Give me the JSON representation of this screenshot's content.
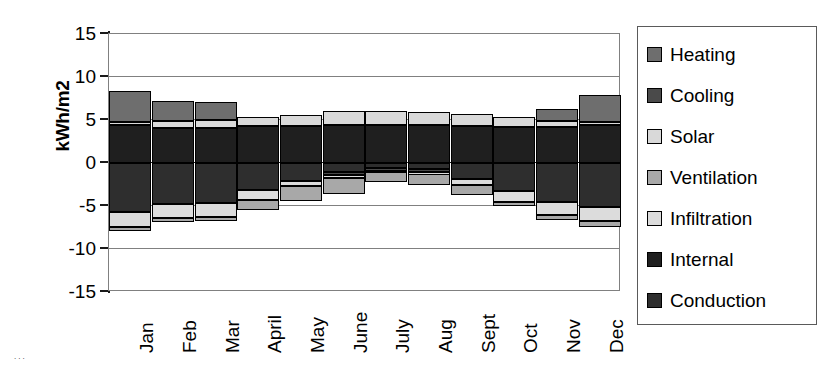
{
  "chart_data": {
    "type": "bar",
    "subtype": "stacked-diverging",
    "title": "",
    "xlabel": "",
    "ylabel": "kWh/m2",
    "ylim": [
      -15,
      15
    ],
    "yticks": [
      15,
      10,
      5,
      0,
      -5,
      -10,
      -15
    ],
    "ytick_labels": [
      "15",
      "10",
      "5",
      "0",
      "-5",
      "-10",
      "-15"
    ],
    "grid": true,
    "grid_axis": "y",
    "legend_position": "right",
    "categories": [
      "Jan",
      "Feb",
      "Mar",
      "April",
      "May",
      "June",
      "July",
      "Aug",
      "Sept",
      "Oct",
      "Nov",
      "Dec"
    ],
    "series": [
      {
        "name": "Heating",
        "color": "#6e6e6e",
        "values": [
          3.6,
          2.4,
          2.2,
          0.0,
          0.0,
          0.0,
          0.0,
          0.0,
          0.0,
          0.0,
          1.4,
          3.1
        ]
      },
      {
        "name": "Cooling",
        "color": "#4a4a4a",
        "values": [
          0.0,
          0.0,
          0.0,
          0.0,
          0.0,
          -0.35,
          -0.35,
          -0.35,
          0.0,
          0.0,
          0.0,
          0.0
        ]
      },
      {
        "name": "Solar",
        "color": "#d9d9d9",
        "values": [
          0.35,
          0.75,
          0.85,
          1.1,
          1.3,
          1.6,
          1.6,
          1.55,
          1.4,
          1.15,
          0.7,
          0.35
        ]
      },
      {
        "name": "Ventilation",
        "color": "#a8a8a8",
        "values": [
          -0.5,
          -0.5,
          -0.5,
          -1.2,
          -1.7,
          -1.9,
          -1.1,
          -1.25,
          -1.1,
          -0.5,
          -0.5,
          -0.6
        ]
      },
      {
        "name": "Infiltration",
        "color": "#dcdcdc",
        "values": [
          -1.7,
          -1.6,
          -1.6,
          -1.2,
          -0.6,
          -0.3,
          -0.15,
          -0.2,
          -0.75,
          -1.2,
          -1.6,
          -1.7
        ]
      },
      {
        "name": "Internal",
        "color": "#1f1f1f",
        "values": [
          4.45,
          4.1,
          4.1,
          4.3,
          4.3,
          4.4,
          4.4,
          4.4,
          4.3,
          4.2,
          4.2,
          4.45
        ]
      },
      {
        "name": "Conduction",
        "color": "#2e2e2e",
        "values": [
          -5.7,
          -4.75,
          -4.65,
          -3.1,
          -2.1,
          -1.05,
          -0.6,
          -0.75,
          -1.85,
          -3.3,
          -4.5,
          -5.1
        ]
      }
    ],
    "positive_stack_order": [
      "Internal",
      "Solar",
      "Heating"
    ],
    "negative_stack_order": [
      "Conduction",
      "Cooling",
      "Infiltration",
      "Ventilation"
    ]
  },
  "legend": {
    "items": [
      {
        "label": "Heating",
        "swatch": "#6e6e6e"
      },
      {
        "label": "Cooling",
        "swatch": "#4a4a4a"
      },
      {
        "label": "Solar",
        "swatch": "#d9d9d9"
      },
      {
        "label": "Ventilation",
        "swatch": "#a8a8a8"
      },
      {
        "label": "Infiltration",
        "swatch": "#dcdcdc"
      },
      {
        "label": "Internal",
        "swatch": "#1f1f1f"
      },
      {
        "label": "Conduction",
        "swatch": "#2e2e2e"
      }
    ]
  },
  "artifact": {
    "text": "..."
  }
}
